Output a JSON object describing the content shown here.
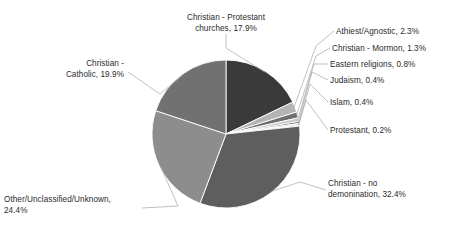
{
  "chart_data": {
    "type": "pie",
    "title": "",
    "subtitle": "",
    "xlabel": "",
    "ylabel": "",
    "legend_position": "none",
    "grid": false,
    "units": "percent",
    "label_format": "{name}, {value}%",
    "start_angle_deg": 0,
    "direction": "clockwise",
    "categories": [
      "Christian - Protestant churches",
      "Athiest/Agnostic",
      "Christian  - Mormon",
      "Eastern religions",
      "Judaism",
      "Islam",
      "Protestant",
      "Christian - no demonination",
      "Other/Unclassified/Unknown",
      "Christian - Catholic"
    ],
    "values": [
      17.9,
      2.3,
      1.3,
      0.8,
      0.4,
      0.4,
      0.2,
      32.4,
      24.4,
      19.9
    ],
    "colors": [
      "#3a3a3a",
      "#b4b4b4",
      "#6f6f6f",
      "#c9c9c9",
      "#4a4a4a",
      "#dcdcdc",
      "#8a8a8a",
      "#5e5e5e",
      "#8d8d8d",
      "#717171"
    ],
    "slices": [
      {
        "name": "Christian - Protestant churches",
        "value": 17.9,
        "color": "#3a3a3a"
      },
      {
        "name": "Athiest/Agnostic",
        "value": 2.3,
        "color": "#b4b4b4"
      },
      {
        "name": "Christian  - Mormon",
        "value": 1.3,
        "color": "#6f6f6f"
      },
      {
        "name": "Eastern religions",
        "value": 0.8,
        "color": "#c9c9c9"
      },
      {
        "name": "Judaism",
        "value": 0.4,
        "color": "#4a4a4a"
      },
      {
        "name": "Islam",
        "value": 0.4,
        "color": "#dcdcdc"
      },
      {
        "name": "Protestant",
        "value": 0.2,
        "color": "#8a8a8a"
      },
      {
        "name": "Christian - no demonination",
        "value": 32.4,
        "color": "#5e5e5e"
      },
      {
        "name": "Other/Unclassified/Unknown",
        "value": 24.4,
        "color": "#8d8d8d"
      },
      {
        "name": "Christian - Catholic",
        "value": 19.9,
        "color": "#717171"
      }
    ]
  },
  "labels": {
    "protestant_churches": "Christian - Protestant\nchurches, 17.9%",
    "atheist": "Athiest/Agnostic, 2.3%",
    "mormon": "Christian  - Mormon, 1.3%",
    "eastern": "Eastern religions, 0.8%",
    "judaism": "Judaism, 0.4%",
    "islam": "Islam, 0.4%",
    "protestant": "Protestant, 0.2%",
    "no_denomination": "Christian - no\ndemonination, 32.4%",
    "other": "Other/Unclassified/Unknown,\n24.4%",
    "catholic": "Christian -\nCatholic, 19.9%"
  },
  "style": {
    "background": "#ffffff",
    "text_color": "#2b2b2b",
    "leader_line_color": "#a6a6a6",
    "slice_border_color": "#ffffff"
  }
}
